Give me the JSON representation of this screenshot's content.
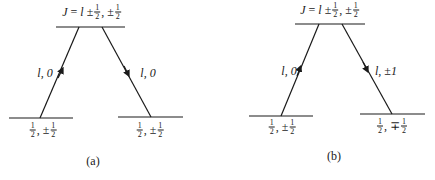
{
  "figure": {
    "panels": [
      {
        "id": "a",
        "caption": "(a)",
        "top_level": {
          "label_prefix": "J = l ±",
          "num": "1",
          "den": "2",
          "mid": ", ±",
          "num2": "1",
          "den2": "2"
        },
        "bottom_left": {
          "num": "1",
          "den": "2",
          "sep": ", ±",
          "num2": "1",
          "den2": "2"
        },
        "bottom_right": {
          "num": "1",
          "den": "2",
          "sep": ", ±",
          "num2": "1",
          "den2": "2"
        },
        "left_transition": {
          "label": "l, 0",
          "direction": "up"
        },
        "right_transition": {
          "label": "l, 0",
          "direction": "down"
        }
      },
      {
        "id": "b",
        "caption": "(b)",
        "top_level": {
          "label_prefix": "J = l ±",
          "num": "1",
          "den": "2",
          "mid": ", ±",
          "num2": "1",
          "den2": "2"
        },
        "bottom_left": {
          "num": "1",
          "den": "2",
          "sep": ", ±",
          "num2": "1",
          "den2": "2"
        },
        "bottom_right": {
          "num": "1",
          "den": "2",
          "sep": ", ∓",
          "num2": "1",
          "den2": "2"
        },
        "left_transition": {
          "label": "l, 0",
          "direction": "up"
        },
        "right_transition": {
          "label": "l, ±1",
          "direction": "down"
        }
      }
    ],
    "colors": {
      "ink": "#1a1a1a",
      "background": "#ffffff"
    }
  }
}
